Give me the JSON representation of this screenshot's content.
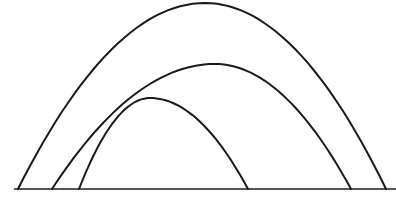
{
  "diagram": {
    "stroke_color": "#1a1a1a",
    "ground_color": "#555555",
    "background": "#ffffff",
    "arcs": [
      {
        "name": "outer-arc",
        "label": ""
      },
      {
        "name": "middle-arc",
        "label": ""
      },
      {
        "name": "inner-arc",
        "label": ""
      }
    ]
  }
}
